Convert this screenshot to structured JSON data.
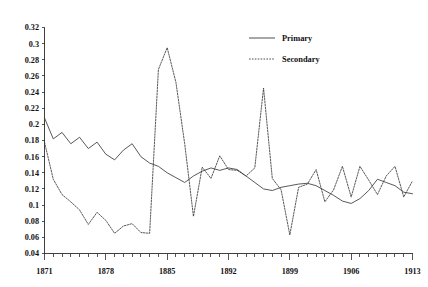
{
  "chart_data": {
    "type": "line",
    "title": "",
    "xlabel": "",
    "ylabel": "",
    "xlim": [
      1871,
      1913
    ],
    "ylim": [
      0.04,
      0.32
    ],
    "ytick_step": 0.02,
    "xtick_step": 1,
    "grid": false,
    "legend_position": "top-right",
    "ytick_labels": [
      "0.04",
      "0.06",
      "0.08",
      "0.1",
      "0.12",
      "0.14",
      "0.16",
      "0.18",
      "0.2",
      "0.22",
      "0.24",
      "0.26",
      "0.28",
      "0.3",
      "0.32"
    ],
    "ytick_values": [
      0.04,
      0.06,
      0.08,
      0.1,
      0.12,
      0.14,
      0.16,
      0.18,
      0.2,
      0.22,
      0.24,
      0.26,
      0.28,
      0.3,
      0.32
    ],
    "xtick_labels": [
      "1871",
      "1878",
      "1885",
      "1892",
      "1899",
      "1906",
      "1913"
    ],
    "xtick_values": [
      1871,
      1878,
      1885,
      1892,
      1899,
      1906,
      1913
    ],
    "x": [
      1871,
      1872,
      1873,
      1874,
      1875,
      1876,
      1877,
      1878,
      1879,
      1880,
      1881,
      1882,
      1883,
      1884,
      1885,
      1886,
      1887,
      1888,
      1889,
      1890,
      1891,
      1892,
      1893,
      1894,
      1895,
      1896,
      1897,
      1898,
      1899,
      1900,
      1901,
      1902,
      1903,
      1904,
      1905,
      1906,
      1907,
      1908,
      1909,
      1910,
      1911,
      1912,
      1913
    ],
    "series": [
      {
        "name": "Primary",
        "style": "solid",
        "values": [
          0.208,
          0.182,
          0.19,
          0.176,
          0.184,
          0.17,
          0.178,
          0.163,
          0.156,
          0.168,
          0.176,
          0.16,
          0.152,
          0.148,
          0.14,
          0.134,
          0.128,
          0.136,
          0.142,
          0.146,
          0.143,
          0.146,
          0.144,
          0.136,
          0.128,
          0.12,
          0.118,
          0.122,
          0.124,
          0.126,
          0.127,
          0.124,
          0.118,
          0.112,
          0.105,
          0.102,
          0.108,
          0.118,
          0.132,
          0.128,
          0.124,
          0.116,
          0.114
        ]
      },
      {
        "name": "Secondary",
        "style": "dotted",
        "values": [
          0.178,
          0.132,
          0.113,
          0.104,
          0.094,
          0.076,
          0.091,
          0.081,
          0.065,
          0.074,
          0.077,
          0.066,
          0.065,
          0.268,
          0.295,
          0.252,
          0.176,
          0.086,
          0.147,
          0.133,
          0.161,
          0.144,
          0.143,
          0.136,
          0.146,
          0.245,
          0.133,
          0.119,
          0.063,
          0.122,
          0.126,
          0.144,
          0.104,
          0.119,
          0.148,
          0.11,
          0.148,
          0.131,
          0.113,
          0.136,
          0.148,
          0.11,
          0.13
        ]
      }
    ]
  },
  "legend": {
    "entries": [
      {
        "label": "Primary",
        "style": "solid"
      },
      {
        "label": "Secondary",
        "style": "dotted"
      }
    ]
  }
}
